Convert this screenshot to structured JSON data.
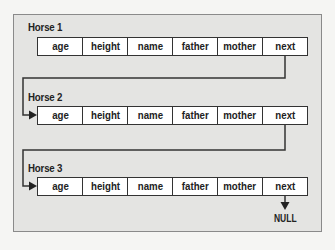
{
  "diagram": {
    "type": "linked-list",
    "nodes": [
      {
        "label": "Horse 1",
        "fields": [
          "age",
          "height",
          "name",
          "father",
          "mother",
          "next"
        ]
      },
      {
        "label": "Horse 2",
        "fields": [
          "age",
          "height",
          "name",
          "father",
          "mother",
          "next"
        ]
      },
      {
        "label": "Horse 3",
        "fields": [
          "age",
          "height",
          "name",
          "father",
          "mother",
          "next"
        ]
      }
    ],
    "terminator": "NULL",
    "edges": [
      {
        "from": "Horse 1.next",
        "to": "Horse 2"
      },
      {
        "from": "Horse 2.next",
        "to": "Horse 3"
      },
      {
        "from": "Horse 3.next",
        "to": "NULL"
      }
    ],
    "colors": {
      "frame_background": "#e4e4e2",
      "page_background": "#f5f5f3",
      "box_background": "#ffffff",
      "line": "#333333"
    }
  }
}
